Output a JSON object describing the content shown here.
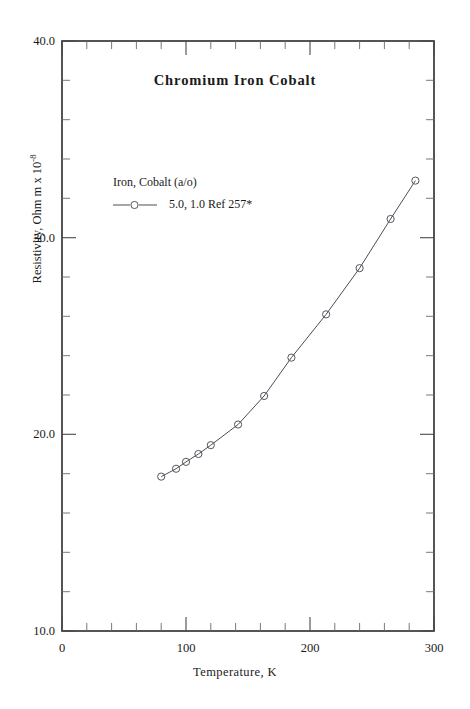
{
  "chart_data": {
    "type": "line",
    "title": "Chromium Iron Cobalt",
    "xlabel": "Temperature,  K",
    "ylabel_text": "Resistivity, Ohm m x 10",
    "ylabel_exponent": "-8",
    "xlim": [
      0,
      300
    ],
    "ylim": [
      10.0,
      40.0
    ],
    "grid": false,
    "legend_position": "upper-left-inside",
    "legend_title": "Iron, Cobalt (a/o)",
    "xticks": [
      0,
      100,
      200,
      300
    ],
    "xtick_labels": [
      "0",
      "100",
      "200",
      "300"
    ],
    "x_minor_step": 20,
    "yticks": [
      10.0,
      20.0,
      30.0,
      40.0
    ],
    "ytick_labels": [
      "10.0",
      "20.0",
      "30.0",
      "40.0"
    ],
    "y_minor_step": 2.0,
    "series": [
      {
        "name": "5.0, 1.0 Ref 257*",
        "marker": "open-circle",
        "x": [
          80,
          92,
          100,
          110,
          120,
          142,
          163,
          185,
          213,
          240,
          265,
          285
        ],
        "y": [
          17.85,
          18.25,
          18.6,
          19.0,
          19.45,
          20.5,
          21.95,
          23.9,
          26.1,
          28.45,
          30.95,
          32.9
        ]
      }
    ],
    "colors": {
      "line": "#4d4d55",
      "marker": "#55555f",
      "frame": "#2b2b2b",
      "text": "#1a1a1a",
      "background": "#ffffff"
    }
  },
  "legend": {
    "title": "Iron, Cobalt (a/o)",
    "entries": [
      {
        "label": "5.0, 1.0 Ref 257*",
        "marker": "open-circle-with-line"
      }
    ]
  },
  "axes": {
    "x_tick_labels": [
      "0",
      "100",
      "200",
      "300"
    ],
    "y_tick_labels": [
      "40.0",
      "30.0",
      "20.0",
      "10.0"
    ],
    "x_axis_title": "Temperature,  K",
    "y_axis_title": "Resistivity, Ohm m x 10",
    "y_axis_title_exponent": "-8"
  },
  "title": "Chromium Iron Cobalt"
}
